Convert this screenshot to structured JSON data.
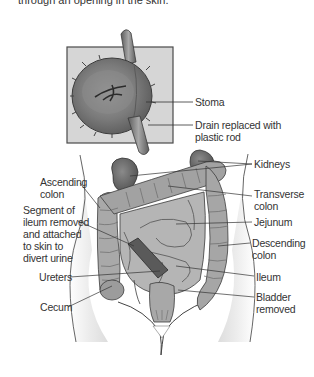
{
  "caption": "through an opening in the skin.",
  "inset": {
    "labels": {
      "stoma": "Stoma",
      "drain_line1": "Drain replaced with",
      "drain_line2": "plastic rod"
    }
  },
  "body_labels": {
    "right": {
      "kidneys": "Kidneys",
      "transverse_colon_1": "Transverse",
      "transverse_colon_2": "colon",
      "jejunum": "Jejunum",
      "descending_colon_1": "Descending",
      "descending_colon_2": "colon",
      "ileum": "Ileum",
      "bladder_removed_1": "Bladder",
      "bladder_removed_2": "removed"
    },
    "left": {
      "ascending_colon_1": "Ascending",
      "ascending_colon_2": "colon",
      "segment_1": "Segment of",
      "segment_2": "ileum removed",
      "segment_3": "and attached",
      "segment_4": "to skin to",
      "segment_5": "divert urine",
      "ureters": "Ureters",
      "cecum": "Cecum"
    }
  },
  "colors": {
    "inset_bg": "#d9d9d9",
    "organ_dark": "#6e6e6e",
    "organ_mid": "#9a9a9a",
    "organ_light": "#bdbdbd",
    "skin_shade": "#e6e6e6",
    "line": "#333333"
  }
}
